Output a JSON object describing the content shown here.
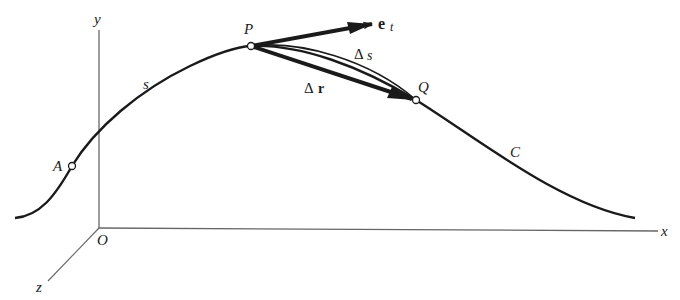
{
  "diagram": {
    "axes": {
      "x_label": "x",
      "y_label": "y",
      "z_label": "z",
      "origin_label": "O"
    },
    "curve_label": "C",
    "arc_label": "s",
    "points": {
      "A": "A",
      "P": "P",
      "Q": "Q"
    },
    "vectors": {
      "tangent_base": "e",
      "tangent_sub": "t",
      "delta_r_sym": "Δ",
      "delta_r_var": "r",
      "delta_s_sym": "Δ",
      "delta_s_var": "s"
    },
    "colors": {
      "ink": "#1a1a1a",
      "axis": "#555555",
      "background": "#ffffff"
    }
  }
}
